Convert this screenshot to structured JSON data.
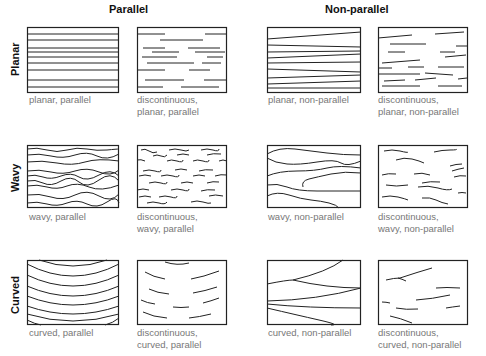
{
  "columns": {
    "parallel": "Parallel",
    "non_parallel": "Non-parallel"
  },
  "rows": {
    "planar": "Planar",
    "wavy": "Wavy",
    "curved": "Curved"
  },
  "captions": {
    "planar_parallel": [
      "planar, parallel"
    ],
    "disc_planar_parallel": [
      "discontinuous,",
      "planar, parallel"
    ],
    "planar_nonparallel": [
      "planar, non-parallel"
    ],
    "disc_planar_nonparallel": [
      "discontinuous,",
      "planar, non-parallel"
    ],
    "wavy_parallel": [
      "wavy, parallel"
    ],
    "disc_wavy_parallel": [
      "discontinuous,",
      "wavy, parallel"
    ],
    "wavy_nonparallel": [
      "wavy, non-parallel"
    ],
    "disc_wavy_nonparallel": [
      "discontinuous,",
      "wavy, non-parallel"
    ],
    "curved_parallel": [
      "curved, parallel"
    ],
    "disc_curved_parallel": [
      "discontinuous,",
      "curved, parallel"
    ],
    "curved_nonparallel": [
      "curved, non-parallel"
    ],
    "disc_curved_nonparallel": [
      "discontinuous,",
      "curved, non-parallel"
    ]
  },
  "colors": {
    "stroke": "#222222",
    "caption": "#777777"
  }
}
